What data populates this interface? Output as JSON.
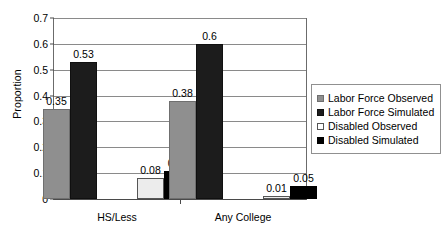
{
  "chart_data": {
    "type": "bar",
    "title": "",
    "subtitle": "",
    "xlabel": "",
    "ylabel": "Proportion",
    "categories": [
      "HS/Less",
      "Any College"
    ],
    "series": [
      {
        "name": "Labor Force Observed",
        "values": [
          0.35,
          0.38
        ],
        "labels": [
          "0.35",
          "0.38"
        ],
        "color": "#8f8f8f"
      },
      {
        "name": "Labor Force Simulated",
        "values": [
          0.53,
          0.6
        ],
        "labels": [
          "0.53",
          "0.6"
        ],
        "color": "#1c1c1c"
      },
      {
        "name": "Disabled Observed",
        "values": [
          0.08,
          0.01
        ],
        "labels": [
          "0.08",
          "0.01"
        ],
        "color": "#ececec"
      },
      {
        "name": "Disabled Simulated",
        "values": [
          0.11,
          0.05
        ],
        "labels": [
          "0.11",
          "0.05"
        ],
        "color": "#000000"
      }
    ],
    "ylim": [
      0,
      0.7
    ],
    "yticks": [
      0,
      0.1,
      0.2,
      0.3,
      0.4,
      0.5,
      0.6,
      0.7
    ],
    "ytick_labels": [
      "0",
      "0.1",
      "0.2",
      "0.3",
      "0.4",
      "0.5",
      "0.6",
      "0.7"
    ],
    "grid": true,
    "grid_axis": "y",
    "data_labels": true,
    "legend_position": "right",
    "legend_entries": [
      "Labor Force Observed",
      "Labor Force Simulated",
      "Disabled Observed",
      "Disabled Simulated"
    ],
    "background_color": "#ffffff",
    "gridline_color": "#8a8a8a",
    "axis_color": "#4a4a4a"
  }
}
